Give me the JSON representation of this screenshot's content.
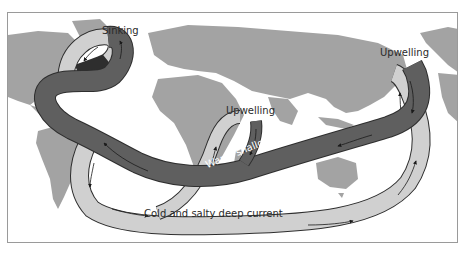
{
  "diagram": {
    "labels": {
      "sinking": "Sinking",
      "upwelling_indian": "Upwelling",
      "upwelling_pacific": "Upwelling",
      "warm_current": "Warm shallow current",
      "cold_current": "Cold and salty deep current"
    },
    "colors": {
      "land": "#a3a3a3",
      "warm_current": "#5f5f5f",
      "cold_current": "#d0d0d0",
      "current_outline": "#2e2e2e",
      "frame_border": "#9a9a9a",
      "background": "#ffffff"
    },
    "legend_semantics": [
      {
        "name": "Warm shallow current",
        "shade": "dark gray"
      },
      {
        "name": "Cold and salty deep current",
        "shade": "light gray"
      }
    ]
  }
}
